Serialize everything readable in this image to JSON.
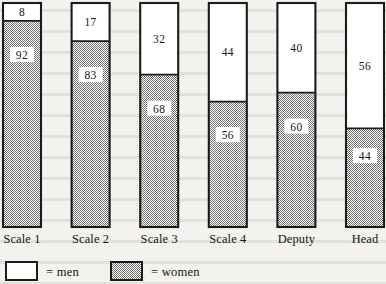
{
  "chart_data": {
    "type": "bar",
    "stacked": true,
    "title": "",
    "xlabel": "",
    "ylabel": "",
    "ylim": [
      0,
      100
    ],
    "grid": false,
    "legend_position": "bottom-left",
    "categories": [
      "Scale 1",
      "Scale 2",
      "Scale 3",
      "Scale 4",
      "Deputy",
      "Head"
    ],
    "series": [
      {
        "name": "men",
        "values": [
          8,
          17,
          32,
          44,
          40,
          56
        ]
      },
      {
        "name": "women",
        "values": [
          92,
          83,
          68,
          56,
          60,
          44
        ]
      }
    ],
    "value_labels": {
      "men": [
        "8",
        "17",
        "32",
        "44",
        "40",
        "56"
      ],
      "women": [
        "92",
        "83",
        "68",
        "56",
        "60",
        "44"
      ]
    }
  },
  "legend": {
    "items": [
      {
        "key": "men",
        "swatch": "white",
        "label": "= men"
      },
      {
        "key": "women",
        "swatch": "dither",
        "label": "= women"
      }
    ]
  },
  "colors": {
    "ink": "#17150f",
    "outline": "#1d1b19",
    "paper": "#f4f2ee",
    "men_fill": "#ffffff",
    "women_fill": "#a8a8a8"
  },
  "axis": {
    "bar_top_value": 100,
    "note": "each bar totals 100 percent"
  }
}
